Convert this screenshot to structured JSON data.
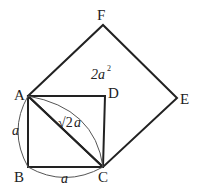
{
  "diagram": {
    "points": {
      "A": {
        "label": "A",
        "x": 28,
        "y": 96
      },
      "B": {
        "label": "B",
        "x": 28,
        "y": 167
      },
      "C": {
        "label": "C",
        "x": 103,
        "y": 167
      },
      "D": {
        "label": "D",
        "x": 105,
        "y": 96
      },
      "E": {
        "label": "E",
        "x": 177,
        "y": 98
      },
      "F": {
        "label": "F",
        "x": 103,
        "y": 25
      }
    },
    "annotations": {
      "side_ab": "a",
      "side_bc": "a",
      "diagonal_root": "√2",
      "diagonal_a": "a",
      "area_coef": "2a",
      "area_exp": "2"
    },
    "colors": {
      "line": "#222222",
      "arc": "#555555",
      "background": "#ffffff"
    }
  }
}
